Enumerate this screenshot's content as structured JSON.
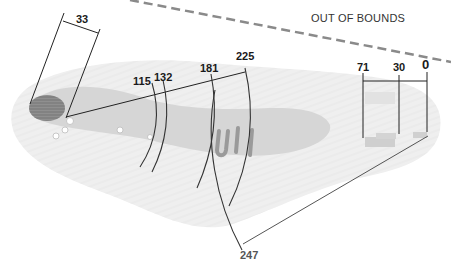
{
  "diagram": {
    "type": "golf-hole-yardage-map",
    "out_of_bounds_label": "OUT OF BOUNDS",
    "colors": {
      "line": "#222222",
      "oob_dash": "#8a8a8a",
      "fairway": "#d9d9d9",
      "rough": "#ececec",
      "bunker": "#8c8c8c",
      "green": "#bdbdbd"
    },
    "measurements": {
      "bunker_width": "33",
      "arc_1": "115",
      "arc_2": "132",
      "arc_3": "181",
      "arc_4": "225",
      "green_front": "71",
      "green_mid": "30",
      "green_back": "0",
      "total": "247"
    }
  }
}
